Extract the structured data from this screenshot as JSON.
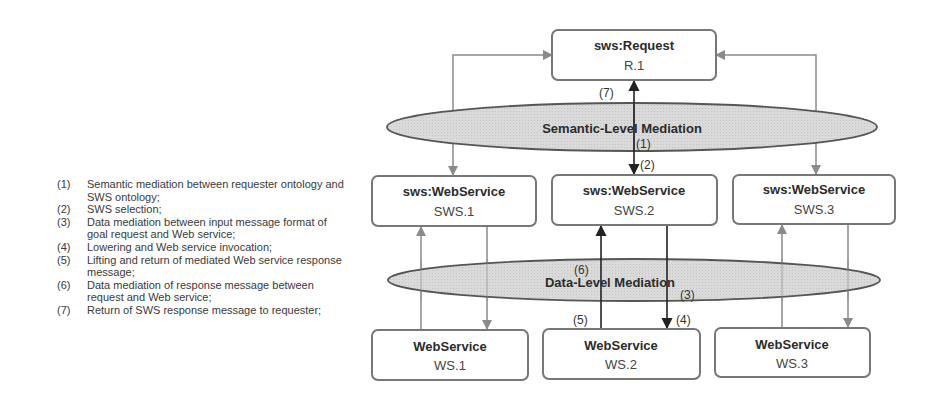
{
  "legend": [
    {
      "num": "(1)",
      "text": "Semantic mediation between requester ontology and SWS ontology;"
    },
    {
      "num": "(2)",
      "text": "SWS selection;"
    },
    {
      "num": "(3)",
      "text": "Data mediation between input message format of goal request and Web service;"
    },
    {
      "num": "(4)",
      "text": "Lowering and Web service invocation;"
    },
    {
      "num": "(5)",
      "text": "Lifting and return of mediated Web service response message;"
    },
    {
      "num": "(6)",
      "text": "Data mediation of response message between request and Web service;"
    },
    {
      "num": "(7)",
      "text": "Return of SWS response message to requester;"
    }
  ],
  "diagram": {
    "request": {
      "title": "sws:Request",
      "id": "R.1"
    },
    "semantic_mediation": {
      "label": "Semantic-Level Mediation"
    },
    "data_mediation": {
      "label": "Data-Level Mediation"
    },
    "sws": [
      {
        "title": "sws:WebService",
        "id": "SWS.1"
      },
      {
        "title": "sws:WebService",
        "id": "SWS.2"
      },
      {
        "title": "sws:WebService",
        "id": "SWS.3"
      }
    ],
    "ws": [
      {
        "title": "WebService",
        "id": "WS.1"
      },
      {
        "title": "WebService",
        "id": "WS.2"
      },
      {
        "title": "WebService",
        "id": "WS.3"
      }
    ],
    "steps": {
      "s1": "(1)",
      "s2": "(2)",
      "s3": "(3)",
      "s4": "(4)",
      "s5": "(5)",
      "s6": "(6)",
      "s7": "(7)"
    }
  },
  "colors": {
    "ellipse_fill": "#d6d6d6",
    "ellipse_stroke": "#555555",
    "box_stroke": "#777777",
    "gray_arrow": "#8a8a8a",
    "dark_arrow": "#222222"
  }
}
